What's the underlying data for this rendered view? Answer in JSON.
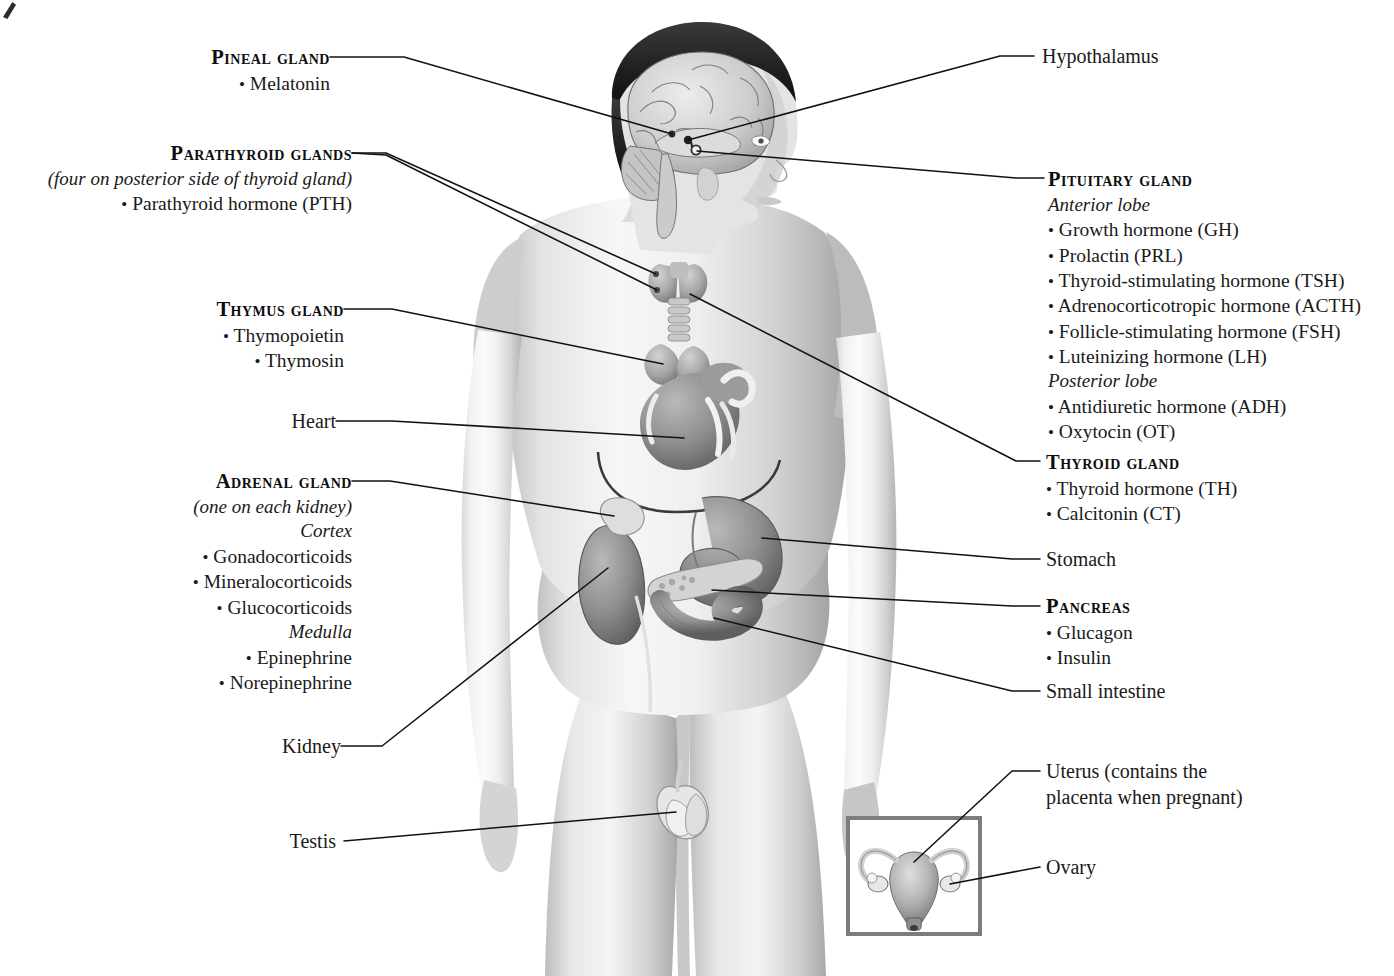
{
  "figure": {
    "body_view": "anterior view of male figure with midsagittal head section",
    "inset_caption": "female reproductive organs inset"
  },
  "colors": {
    "leader": "#111111",
    "text": "#1a1a1a",
    "inset_border": "#7d7d7d",
    "background": "#ffffff"
  },
  "labels": {
    "pineal": {
      "heading": "Pineal gland",
      "items": [
        "Melatonin"
      ]
    },
    "parathyroid": {
      "heading": "Parathyroid glands",
      "note": "(four on posterior side of thyroid gland)",
      "items": [
        "Parathyroid hormone (PTH)"
      ]
    },
    "thymus": {
      "heading": "Thymus gland",
      "items": [
        "Thymopoietin",
        "Thymosin"
      ]
    },
    "heart": {
      "heading": "Heart"
    },
    "adrenal": {
      "heading": "Adrenal gland",
      "note": "(one on each kidney)",
      "group1": "Cortex",
      "group1_items": [
        "Gonadocorticoids",
        "Mineralocorticoids",
        "Glucocorticoids"
      ],
      "group2": "Medulla",
      "group2_items": [
        "Epinephrine",
        "Norepinephrine"
      ]
    },
    "kidney": {
      "heading": "Kidney"
    },
    "testis": {
      "heading": "Testis"
    },
    "hypothalamus": {
      "heading": "Hypothalamus"
    },
    "pituitary": {
      "heading": "Pituitary gland",
      "group1": "Anterior lobe",
      "group1_items": [
        "Growth hormone (GH)",
        "Prolactin (PRL)",
        "Thyroid-stimulating hormone (TSH)",
        "Adrenocorticotropic hormone (ACTH)",
        "Follicle-stimulating hormone (FSH)",
        "Luteinizing hormone (LH)"
      ],
      "group2": "Posterior lobe",
      "group2_items": [
        "Antidiuretic hormone (ADH)",
        "Oxytocin (OT)"
      ]
    },
    "thyroid": {
      "heading": "Thyroid gland",
      "items": [
        "Thyroid hormone (TH)",
        "Calcitonin (CT)"
      ]
    },
    "stomach": {
      "heading": "Stomach"
    },
    "pancreas": {
      "heading": "Pancreas",
      "items": [
        "Glucagon",
        "Insulin"
      ]
    },
    "small_intestine": {
      "heading": "Small intestine"
    },
    "uterus": {
      "heading_line1": "Uterus (contains the",
      "heading_line2": "placenta when pregnant)"
    },
    "ovary": {
      "heading": "Ovary"
    }
  },
  "bullet": "•"
}
